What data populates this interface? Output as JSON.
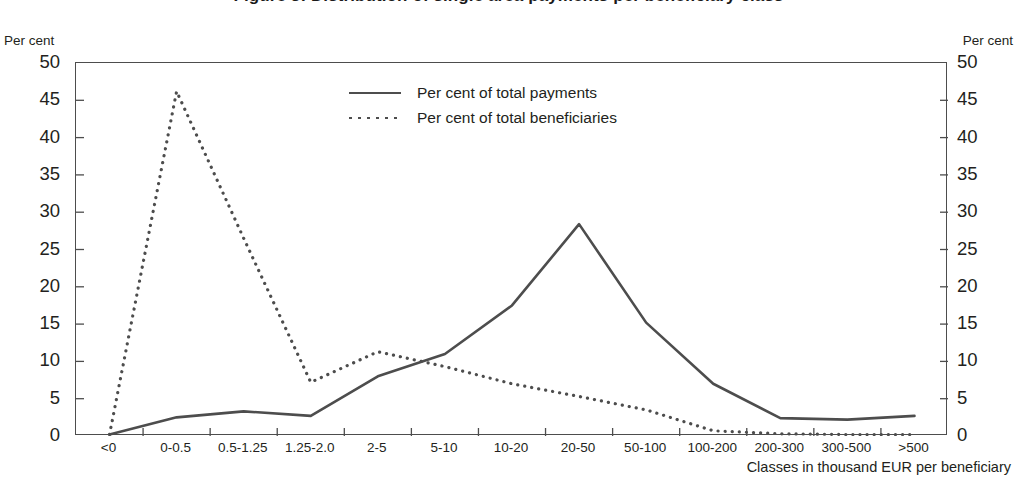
{
  "figure": {
    "title": "Figure 3: Distribution of single area payments per beneficiary class",
    "y_axis_caption_left": "Per cent",
    "y_axis_caption_right": "Per cent",
    "x_axis_title": "Classes in thousand EUR per beneficiary"
  },
  "legend": {
    "position": "inside-top-center",
    "items": [
      {
        "label": "Per cent of total payments",
        "style": "solid",
        "color": "#4d4d4d"
      },
      {
        "label": "Per cent of total beneficiaries",
        "style": "dotted",
        "color": "#4d4d4d"
      }
    ]
  },
  "chart_data": {
    "type": "line",
    "title": "Figure 3: Distribution of single area payments per beneficiary class",
    "xlabel": "Classes in thousand EUR per beneficiary",
    "ylabel": "Per cent",
    "ylim": [
      0,
      50
    ],
    "ytick_step": 5,
    "yticks": [
      "0",
      "5",
      "10",
      "15",
      "20",
      "25",
      "30",
      "35",
      "40",
      "45",
      "50"
    ],
    "grid": false,
    "dual_y_axis": true,
    "categories": [
      "<0",
      "0-0.5",
      "0.5-1.25",
      "1.25-2.0",
      "2-5",
      "5-10",
      "10-20",
      "20-50",
      "50-100",
      "100-200",
      "200-300",
      "300-500",
      ">500"
    ],
    "series": [
      {
        "name": "Per cent of total payments",
        "style": "solid",
        "color": "#4d4d4d",
        "values": [
          0.2,
          2.5,
          3.3,
          2.7,
          8.0,
          11.0,
          17.5,
          28.4,
          15.2,
          7.0,
          2.4,
          2.2,
          2.7
        ]
      },
      {
        "name": "Per cent of total beneficiaries",
        "style": "dotted",
        "color": "#4d4d4d",
        "values": [
          0.2,
          46.2,
          26.5,
          7.2,
          11.3,
          9.3,
          7.0,
          5.3,
          3.5,
          0.7,
          0.3,
          0.2,
          0.2
        ]
      }
    ]
  }
}
